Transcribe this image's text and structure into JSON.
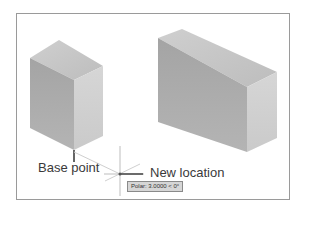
{
  "labels": {
    "base_point": "Base point",
    "new_location": "New location"
  },
  "tooltip": {
    "text": "Polar: 3.0000 < 0°"
  },
  "colors": {
    "box_top": "#c6c6c6",
    "box_left": "#a9a9a9",
    "box_right": "#d2d2d2",
    "frame": "#9a9a9a",
    "crosshair": "#888888",
    "tooltip_bg": "#d6d6d6"
  }
}
